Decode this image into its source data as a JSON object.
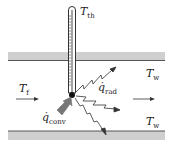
{
  "diagram": {
    "labels": {
      "thermometer_temp": {
        "main": "T",
        "sub": "th"
      },
      "wall_temp_top": {
        "main": "T",
        "sub": "w"
      },
      "wall_temp_bottom": {
        "main": "T",
        "sub": "w"
      },
      "fluid_temp": {
        "main": "T",
        "sub": "f"
      },
      "radiation_heat": {
        "main": "q̇",
        "sub": "rad"
      },
      "convection_heat": {
        "main": "q̇",
        "sub": "conv"
      }
    },
    "colors": {
      "wall_fill": "#c8c8c8",
      "wall_edge": "#555555",
      "line": "#333333",
      "conv_arrow": "#777777",
      "bulb": "#111111"
    }
  }
}
